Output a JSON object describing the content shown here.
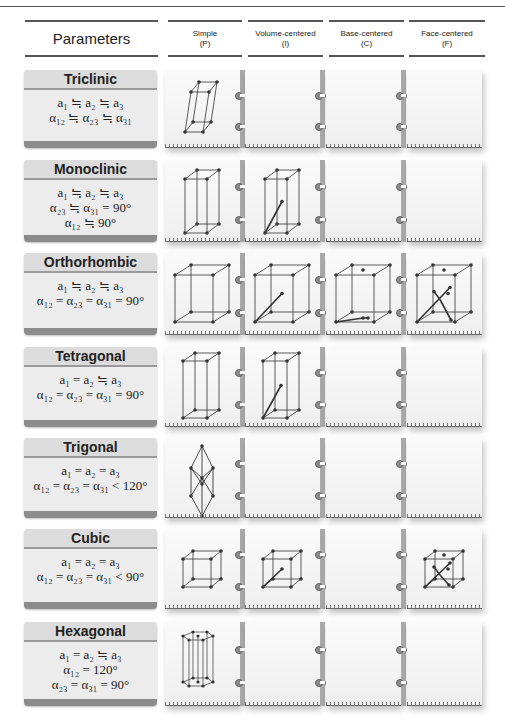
{
  "header": {
    "parameters": "Parameters",
    "columns": [
      {
        "name": "Simple",
        "symbol": "(P)"
      },
      {
        "name": "Volume-centered",
        "symbol": "(I)"
      },
      {
        "name": "Base-centered",
        "symbol": "(C)"
      },
      {
        "name": "Face-centered",
        "symbol": "(F)"
      }
    ]
  },
  "systems": [
    {
      "name": "Triclinic",
      "lines": [
        "a₁ ≒ a₂ ≒ a₃",
        "α₁₂ ≒ α₂₃ ≒ α₃₁"
      ],
      "lattices": [
        "P"
      ]
    },
    {
      "name": "Monoclinic",
      "lines": [
        "a₁ ≒ a₂ ≒ a₃",
        "α₂₃ ≒ α₃₁ = 90°",
        "α₁₂ ≒ 90°"
      ],
      "lattices": [
        "P",
        "I"
      ]
    },
    {
      "name": "Orthorhombic",
      "lines": [
        "a₁ ≒ a₂ ≒ a₃",
        "α₁₂ = α₂₃ = α₃₁ = 90°"
      ],
      "lattices": [
        "P",
        "I",
        "C",
        "F"
      ]
    },
    {
      "name": "Tetragonal",
      "lines": [
        "a₁ = a₂ ≒ a₃",
        "α₁₂ = α₂₃ = α₃₁ = 90°"
      ],
      "lattices": [
        "P",
        "I"
      ]
    },
    {
      "name": "Trigonal",
      "lines": [
        "a₁ = a₂ = a₃",
        "α₁₂ = α₂₃ = α₃₁ < 120°"
      ],
      "lattices": [
        "P"
      ]
    },
    {
      "name": "Cubic",
      "lines": [
        "a₁ = a₂ = a₃",
        "α₁₂ = α₂₃ = α₃₁ < 90°"
      ],
      "lattices": [
        "P",
        "I",
        "F"
      ]
    },
    {
      "name": "Hexagonal",
      "lines": [
        "a₁ = a₂ ≒ a₃",
        "α₁₂ = 120°",
        "α₂₃ = α₃₁ = 90°"
      ],
      "lattices": [
        "P"
      ]
    }
  ],
  "colors": {
    "card_bg": "#ececec",
    "card_title_bg": "#dcdcdc",
    "card_footer": "#8c8c8c",
    "spine": "#a9a9a9",
    "line": "#333333"
  }
}
